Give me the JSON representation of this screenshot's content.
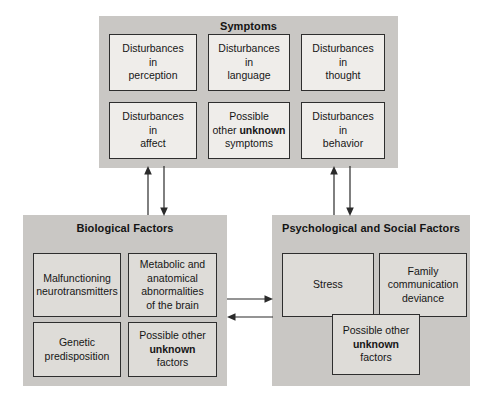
{
  "diagram": {
    "title_semantic": "biopsychosocial-model-of-schizophrenia",
    "colors": {
      "panel_fill": "#c9c7c4",
      "box_fill_light": "#efedea",
      "box_fill_mid": "#dedcd8",
      "box_border": "#2e2e2e",
      "arrow": "#2b2b2b",
      "text": "#161616",
      "background": "#ffffff"
    },
    "panels": [
      {
        "id": "symptoms",
        "title": "Symptoms",
        "boxes": [
          {
            "id": "disturbances-perception",
            "line1": "Disturbances",
            "line2": "in",
            "line3": "perception",
            "bold": ""
          },
          {
            "id": "disturbances-language",
            "line1": "Disturbances",
            "line2": "in",
            "line3": "language",
            "bold": ""
          },
          {
            "id": "disturbances-thought",
            "line1": "Disturbances",
            "line2": "in",
            "line3": "thought",
            "bold": ""
          },
          {
            "id": "disturbances-affect",
            "line1": "Disturbances",
            "line2": "in",
            "line3": "affect",
            "bold": ""
          },
          {
            "id": "possible-other-unknown-symptoms",
            "line1": "Possible",
            "line2": "other ",
            "bold": "unknown",
            "line3": "symptoms"
          },
          {
            "id": "disturbances-behavior",
            "line1": "Disturbances",
            "line2": "in",
            "line3": "behavior",
            "bold": ""
          }
        ]
      },
      {
        "id": "biological-factors",
        "title": "Biological Factors",
        "boxes": [
          {
            "id": "malfunctioning-neurotransmitters",
            "line1": "Malfunctioning",
            "line2": "neurotransmitters",
            "line3": "",
            "bold": ""
          },
          {
            "id": "metabolic-anatomical-abnormalities",
            "line1": "Metabolic and",
            "line2": "anatomical",
            "line3": "abnormalities",
            "line4": "of the brain",
            "bold": ""
          },
          {
            "id": "genetic-predisposition",
            "line1": "Genetic",
            "line2": "predisposition",
            "line3": "",
            "bold": ""
          },
          {
            "id": "possible-other-unknown-factors-biological",
            "line1": "Possible other",
            "bold": "unknown",
            "line3": "factors"
          }
        ]
      },
      {
        "id": "psychological-social-factors",
        "title": "Psychological and Social Factors",
        "boxes": [
          {
            "id": "stress",
            "line1": "Stress",
            "line2": "",
            "line3": "",
            "bold": ""
          },
          {
            "id": "family-communication-deviance",
            "line1": "Family",
            "line2": "communication",
            "line3": "deviance",
            "bold": ""
          },
          {
            "id": "possible-other-unknown-factors-psychosocial",
            "line1": "Possible other",
            "bold": "unknown",
            "line3": "factors"
          }
        ]
      }
    ],
    "arrows": [
      {
        "id": "biological-to-symptoms",
        "direction": "up"
      },
      {
        "id": "symptoms-to-biological",
        "direction": "down"
      },
      {
        "id": "psychosocial-to-symptoms",
        "direction": "up"
      },
      {
        "id": "symptoms-to-psychosocial",
        "direction": "down"
      },
      {
        "id": "biological-to-psychosocial",
        "direction": "right"
      },
      {
        "id": "psychosocial-to-biological",
        "direction": "left"
      }
    ]
  }
}
